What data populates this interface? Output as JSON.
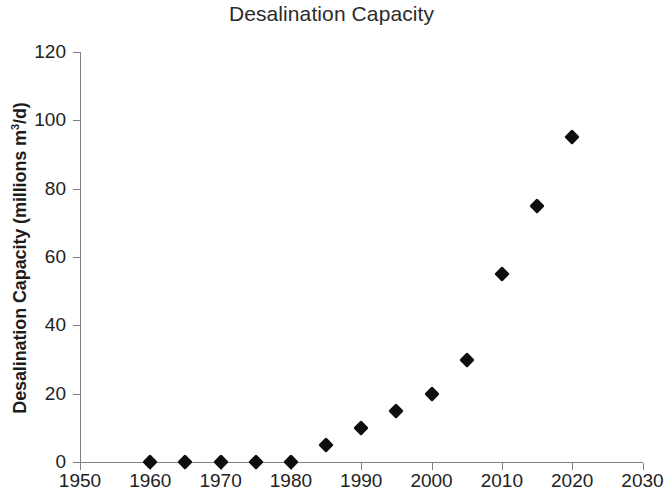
{
  "chart_data": {
    "type": "scatter",
    "title": "Desalination Capacity",
    "xlabel": "",
    "ylabel": "Desalination Capacity (millions m³/d)",
    "ylabel_parts": {
      "before": "Desalination Capacity (millions m",
      "superscript": "3",
      "after": "/d)"
    },
    "x": [
      1960,
      1965,
      1970,
      1975,
      1980,
      1985,
      1990,
      1995,
      2000,
      2005,
      2010,
      2015,
      2020
    ],
    "values": [
      0,
      0,
      0,
      0,
      0,
      5,
      10,
      15,
      20,
      30,
      55,
      75,
      95
    ],
    "series": [
      {
        "name": "Desalination Capacity",
        "marker": "diamond",
        "color": "#0d0d0d",
        "points": [
          {
            "x": 1960,
            "y": 0
          },
          {
            "x": 1965,
            "y": 0
          },
          {
            "x": 1970,
            "y": 0
          },
          {
            "x": 1975,
            "y": 0
          },
          {
            "x": 1980,
            "y": 0
          },
          {
            "x": 1985,
            "y": 5
          },
          {
            "x": 1990,
            "y": 10
          },
          {
            "x": 1995,
            "y": 15
          },
          {
            "x": 2000,
            "y": 20
          },
          {
            "x": 2005,
            "y": 30
          },
          {
            "x": 2010,
            "y": 55
          },
          {
            "x": 2015,
            "y": 75
          },
          {
            "x": 2020,
            "y": 95
          }
        ]
      }
    ],
    "xlim": [
      1950,
      2030
    ],
    "ylim": [
      0,
      120
    ],
    "xticks": [
      1950,
      1960,
      1970,
      1980,
      1990,
      2000,
      2010,
      2020,
      2030
    ],
    "yticks": [
      0,
      20,
      40,
      60,
      80,
      100,
      120
    ],
    "xtick_labels": [
      "1950",
      "1960",
      "1970",
      "1980",
      "1990",
      "2000",
      "2010",
      "2020",
      "2030"
    ],
    "ytick_labels": [
      "0",
      "20",
      "40",
      "60",
      "80",
      "100",
      "120"
    ],
    "grid": false,
    "legend": false,
    "axis_color": "#808080",
    "background": "#ffffff"
  }
}
